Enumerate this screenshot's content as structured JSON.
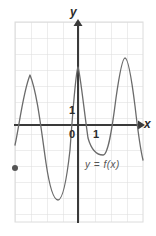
{
  "figure": {
    "kind": "cartesian-graph",
    "bullet_marker": "●",
    "labels": {
      "y_axis": "y",
      "x_axis": "x",
      "y_unit": "1",
      "origin": "0",
      "x_unit": "1",
      "function": "y = f(x)"
    },
    "colors": {
      "grid": "#dcdcdc",
      "axis": "#3a3a3a",
      "curve": "#6b6b6b",
      "text": "#2b2b2b",
      "bullet": "#555555"
    }
  },
  "chart_data": {
    "type": "line",
    "title": "",
    "xlabel": "x",
    "ylabel": "y",
    "annotations": [
      "y = f(x)"
    ],
    "grid": true,
    "legend": "none",
    "axis_origin_px": [
      78,
      125
    ],
    "grid_cell_px": 16,
    "grid_extent_px": {
      "x0": 15,
      "x1": 143,
      "y0": 22,
      "y1": 222
    },
    "xlim": [
      -4,
      4.2
    ],
    "ylim": [
      -6.3,
      6.3
    ],
    "xticks": [
      0,
      1
    ],
    "yticks": [
      0,
      1
    ],
    "key_points_px": {
      "peaks": [
        [
          30,
          75
        ],
        [
          78,
          67
        ],
        [
          125,
          58
        ]
      ],
      "troughs": [
        [
          58,
          200
        ],
        [
          103,
          155
        ]
      ],
      "start": [
        15,
        145
      ],
      "end": [
        143,
        160
      ]
    },
    "curve_path": "M 15,145 C 19,128 23,92 30,75 C 37,92 41,128 46,163 C 50,190 54,200 58,200 C 62,200 66,186 70,150 C 73,108 76,72 78,67 C 80,72 84,110 88,138 C 92,152 98,155 103,155 C 108,155 112,130 116,98 C 120,70 123,58 125,58 C 128,58 131,74 135,106 C 138,132 141,152 143,160"
  }
}
